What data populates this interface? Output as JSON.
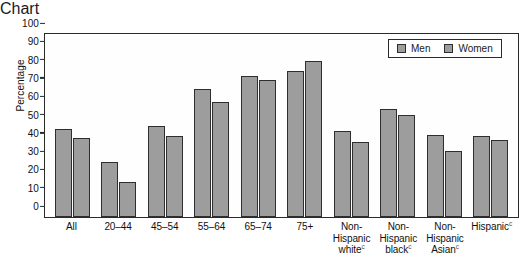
{
  "chart_data": {
    "type": "bar",
    "title": "",
    "xlabel": "",
    "ylabel": "Percentage",
    "ylim": [
      0,
      100
    ],
    "ytick_step": 10,
    "grid": false,
    "legend_position": "top-right",
    "categories": [
      "All",
      "20–44",
      "45–54",
      "55–64",
      "65–74",
      "75+",
      "Non-Hispanic white",
      "Non-Hispanic black",
      "Non-Hispanic Asian",
      "Hispanic"
    ],
    "series": [
      {
        "name": "Men",
        "values": [
          48,
          30,
          50,
          70,
          77,
          80,
          47,
          59,
          45,
          44
        ]
      },
      {
        "name": "Women",
        "values": [
          43,
          19,
          44,
          63,
          75,
          85,
          41,
          56,
          36,
          42
        ]
      }
    ],
    "yticks": [
      "0",
      "10",
      "20",
      "30",
      "40",
      "50",
      "60",
      "70",
      "80",
      "90",
      "100"
    ],
    "footnote_marker": "c",
    "colors": {
      "bar_fill": "#9d9d9d",
      "bar_stroke": "#2e2e2e",
      "axis": "#2b2b2b",
      "text": "#111111",
      "background": "#ffffff"
    }
  },
  "axis": {
    "y_title": "Percentage"
  },
  "legend": {
    "items": [
      {
        "label": "Men"
      },
      {
        "label": "Women"
      }
    ]
  },
  "x_axis_labels": [
    {
      "lines": [
        "All"
      ],
      "marker": ""
    },
    {
      "lines": [
        "20–44"
      ],
      "marker": ""
    },
    {
      "lines": [
        "45–54"
      ],
      "marker": ""
    },
    {
      "lines": [
        "55–64"
      ],
      "marker": ""
    },
    {
      "lines": [
        "65–74"
      ],
      "marker": ""
    },
    {
      "lines": [
        "75+"
      ],
      "marker": ""
    },
    {
      "lines": [
        "Non-",
        "Hispanic",
        "white"
      ],
      "marker": "c"
    },
    {
      "lines": [
        "Non-",
        "Hispanic",
        "black"
      ],
      "marker": "c"
    },
    {
      "lines": [
        "Non-",
        "Hispanic",
        "Asian"
      ],
      "marker": "c"
    },
    {
      "lines": [
        "Hispanic"
      ],
      "marker": "c"
    }
  ]
}
